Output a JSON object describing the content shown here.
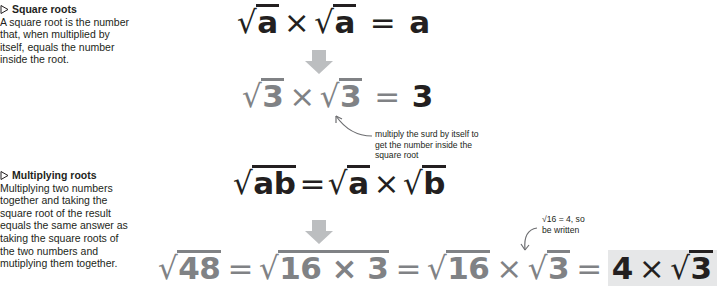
{
  "sections": [
    {
      "heading": "Square roots",
      "body": "A square root is the number that, when multiplied by itself, equals the number inside the root."
    },
    {
      "heading": "Multiplying roots",
      "body": "Multiplying two numbers together and taking the square root of the result equals the same answer as taking the square roots of the two numbers and mutiplying them together."
    }
  ],
  "equations": {
    "rule1": {
      "a1": "a",
      "times": "×",
      "a2": "a",
      "equals": "=",
      "result": "a"
    },
    "example1": {
      "n1": "3",
      "times": "×",
      "n2": "3",
      "equals": "=",
      "result": "3"
    },
    "rule2": {
      "ab": "ab",
      "equals": "=",
      "a": "a",
      "times": "×",
      "b": "b"
    },
    "example2": {
      "n": "48",
      "eq1": "=",
      "inner": "16 × 3",
      "eq2": "=",
      "r1": "16",
      "times1": "×",
      "r2": "3",
      "eq3": "=",
      "coef": "4",
      "times2": "×",
      "r3": "3"
    }
  },
  "annotations": {
    "surd_note": "multiply the surd by itself to get the number inside the square root",
    "sixteen_note_line1": "√16 = 4, so",
    "sixteen_note_line2": "be written"
  },
  "symbols": {
    "sqrt": "√",
    "bullet": "▷"
  },
  "colors": {
    "text": "#231f20",
    "grey_math": "#808285",
    "arrow": "#bcbec0",
    "highlight": "#e6e7e8"
  }
}
